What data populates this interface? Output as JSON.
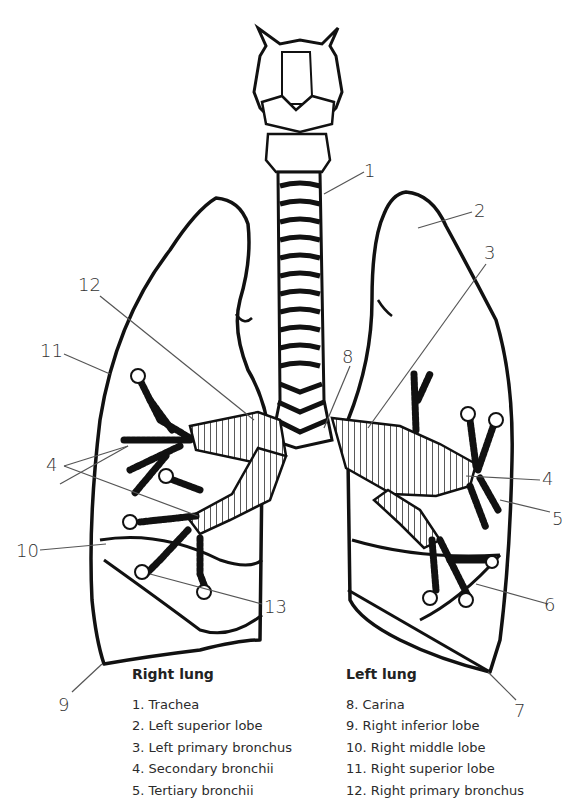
{
  "diagram": {
    "callout_numbers": [
      "1",
      "2",
      "3",
      "4",
      "4",
      "4",
      "5",
      "6",
      "7",
      "8",
      "9",
      "10",
      "11",
      "12",
      "13"
    ]
  },
  "callouts": {
    "n1": "1",
    "n2": "2",
    "n3": "3",
    "n4_left": "4",
    "n4_right": "4",
    "n5": "5",
    "n6": "6",
    "n7": "7",
    "n8": "8",
    "n9": "9",
    "n10": "10",
    "n11": "11",
    "n12": "12",
    "n13": "13"
  },
  "legend": {
    "right_lung": {
      "heading": "Right lung",
      "items": [
        "1. Trachea",
        "2. Left superior lobe",
        "3. Left primary bronchus",
        "4. Secondary bronchii",
        "5. Tertiary bronchii"
      ]
    },
    "left_lung": {
      "heading": "Left lung",
      "items": [
        "8. Carina",
        "9. Right inferior lobe",
        "10. Right middle lobe",
        "11. Right superior lobe",
        "12. Right primary bronchus"
      ]
    }
  },
  "colors": {
    "ink": "#111111",
    "leader_line": "#555555",
    "text": "#2b2b2b",
    "background": "#ffffff"
  }
}
